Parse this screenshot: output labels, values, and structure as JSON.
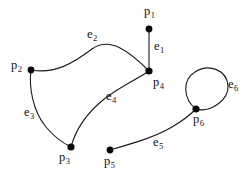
{
  "figure": {
    "type": "graph-diagram",
    "background_color": "#ffffff",
    "stroke_color": "#1a1a1a",
    "vertex_color": "#0a0a0a"
  },
  "vertices": [
    {
      "id": "p1",
      "base": "p",
      "index": "1",
      "label": "p1",
      "x": 149,
      "y": 29,
      "r": 3.4,
      "label_x": 144,
      "label_y": 5
    },
    {
      "id": "p2",
      "base": "p",
      "index": "2",
      "label": "p2",
      "x": 31,
      "y": 70,
      "r": 3.4,
      "label_x": 11,
      "label_y": 59
    },
    {
      "id": "p3",
      "base": "p",
      "index": "3",
      "label": "p3",
      "x": 71,
      "y": 147,
      "r": 3.6,
      "label_x": 59,
      "label_y": 151
    },
    {
      "id": "p4",
      "base": "p",
      "index": "4",
      "label": "p4",
      "x": 149,
      "y": 71,
      "r": 3.6,
      "label_x": 153,
      "label_y": 76
    },
    {
      "id": "p5",
      "base": "p",
      "index": "5",
      "label": "p5",
      "x": 110,
      "y": 150,
      "r": 3.4,
      "label_x": 104,
      "label_y": 155
    },
    {
      "id": "p6",
      "base": "p",
      "index": "6",
      "label": "p6",
      "x": 196,
      "y": 109,
      "r": 3.6,
      "label_x": 193,
      "label_y": 113
    }
  ],
  "edges": [
    {
      "id": "e1",
      "base": "e",
      "index": "1",
      "label": "e1",
      "from": "p1",
      "to": "p4",
      "kind": "straight",
      "path": "M 149 29 L 149 71",
      "label_x": 154,
      "label_y": 40
    },
    {
      "id": "e2",
      "base": "e",
      "index": "2",
      "label": "e2",
      "from": "p2",
      "to": "p4",
      "kind": "curve",
      "path": "M 31 70 C 55 74, 72 64, 92 49 C 110 36, 130 52, 149 71",
      "label_x": 87,
      "label_y": 28
    },
    {
      "id": "e3",
      "base": "e",
      "index": "3",
      "label": "e3",
      "from": "p2",
      "to": "p3",
      "kind": "curve",
      "path": "M 31 70 C 29 86, 32 110, 46 127 C 55 138, 63 143, 71 147",
      "label_x": 24,
      "label_y": 106
    },
    {
      "id": "e4",
      "base": "e",
      "index": "4",
      "label": "e4",
      "from": "p3",
      "to": "p4",
      "kind": "curve",
      "path": "M 71 147 C 76 128, 86 114, 103 100 C 120 86, 138 79, 149 71",
      "label_x": 106,
      "label_y": 90
    },
    {
      "id": "e5",
      "base": "e",
      "index": "5",
      "label": "e5",
      "from": "p5",
      "to": "p6",
      "kind": "curve",
      "path": "M 110 150 C 134 143, 155 137, 172 127 C 184 120, 191 114, 196 109",
      "label_x": 153,
      "label_y": 136
    },
    {
      "id": "e6",
      "base": "e",
      "index": "6",
      "label": "e6",
      "from": "p6",
      "to": "p6",
      "kind": "self-loop",
      "path": "M 196 109 C 183 99, 182 80, 195 72 C 209 63, 227 70, 228 86 C 229 100, 210 113, 196 109 Z",
      "loop_center_x": 209,
      "loop_center_y": 89,
      "loop_radius": 18,
      "label_x": 228,
      "label_y": 78
    }
  ]
}
